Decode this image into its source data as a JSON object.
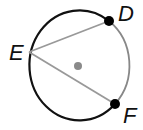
{
  "figure": {
    "type": "circle-inscribed-angle",
    "points": [
      {
        "label": "D",
        "x": 109,
        "y": 21
      },
      {
        "label": "E",
        "x": 29,
        "y": 52
      },
      {
        "label": "F",
        "x": 115,
        "y": 104
      }
    ],
    "center": {
      "x": 78,
      "y": 66
    },
    "chords": [
      "ED",
      "EF"
    ],
    "highlighted_arc": "DF",
    "colors": {
      "circle": "#111111",
      "arc_DF": "#888888",
      "chords": "#999999",
      "center_dot": "#8a8a8a",
      "points": "#000000"
    }
  }
}
